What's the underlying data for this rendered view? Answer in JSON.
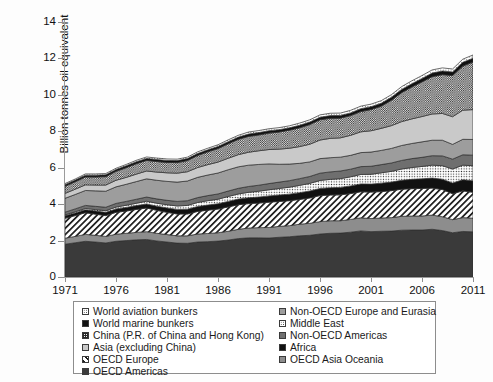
{
  "chart_data": {
    "type": "area",
    "stacked": true,
    "title": "",
    "xlabel": "",
    "ylabel": "Billion tonnes oil equivalent",
    "ylim": [
      0,
      14
    ],
    "yticks": [
      0,
      2,
      4,
      6,
      8,
      10,
      12,
      14
    ],
    "xlim": [
      1971,
      2011
    ],
    "xticks": [
      1971,
      1976,
      1981,
      1986,
      1991,
      1996,
      2001,
      2006,
      2011
    ],
    "grid": false,
    "legend_position": "bottom",
    "x": [
      1971,
      1972,
      1973,
      1974,
      1975,
      1976,
      1977,
      1978,
      1979,
      1980,
      1981,
      1982,
      1983,
      1984,
      1985,
      1986,
      1987,
      1988,
      1989,
      1990,
      1991,
      1992,
      1993,
      1994,
      1995,
      1996,
      1997,
      1998,
      1999,
      2000,
      2001,
      2002,
      2003,
      2004,
      2005,
      2006,
      2007,
      2008,
      2009,
      2010,
      2011
    ],
    "series": [
      {
        "name": "OECD Americas",
        "pattern": "solid-dark",
        "color": "#3a3a3a",
        "values": [
          1.8,
          1.88,
          1.96,
          1.92,
          1.87,
          1.96,
          2.0,
          2.04,
          2.06,
          1.98,
          1.92,
          1.86,
          1.85,
          1.92,
          1.94,
          1.97,
          2.03,
          2.11,
          2.15,
          2.15,
          2.14,
          2.18,
          2.21,
          2.26,
          2.29,
          2.36,
          2.4,
          2.41,
          2.46,
          2.53,
          2.49,
          2.51,
          2.52,
          2.57,
          2.58,
          2.58,
          2.62,
          2.55,
          2.43,
          2.5,
          2.48
        ]
      },
      {
        "name": "OECD Asia Oceania",
        "pattern": "solid-mid",
        "color": "#8d8d8d",
        "values": [
          0.33,
          0.35,
          0.38,
          0.37,
          0.36,
          0.39,
          0.4,
          0.41,
          0.43,
          0.42,
          0.41,
          0.4,
          0.41,
          0.44,
          0.45,
          0.46,
          0.48,
          0.51,
          0.54,
          0.56,
          0.58,
          0.6,
          0.61,
          0.64,
          0.66,
          0.68,
          0.69,
          0.68,
          0.7,
          0.72,
          0.72,
          0.73,
          0.74,
          0.76,
          0.77,
          0.77,
          0.78,
          0.76,
          0.72,
          0.76,
          0.75
        ]
      },
      {
        "name": "OECD Europe",
        "pattern": "diagonal-hatch",
        "color": "#ffffff",
        "values": [
          1.09,
          1.14,
          1.19,
          1.16,
          1.14,
          1.2,
          1.22,
          1.26,
          1.3,
          1.26,
          1.22,
          1.2,
          1.2,
          1.24,
          1.28,
          1.3,
          1.34,
          1.35,
          1.34,
          1.35,
          1.39,
          1.37,
          1.37,
          1.36,
          1.39,
          1.43,
          1.41,
          1.42,
          1.42,
          1.43,
          1.45,
          1.45,
          1.48,
          1.49,
          1.5,
          1.51,
          1.48,
          1.49,
          1.42,
          1.47,
          1.42
        ]
      },
      {
        "name": "Africa",
        "pattern": "black",
        "color": "#111111",
        "values": [
          0.14,
          0.15,
          0.16,
          0.17,
          0.18,
          0.19,
          0.2,
          0.21,
          0.22,
          0.23,
          0.24,
          0.25,
          0.26,
          0.27,
          0.28,
          0.29,
          0.3,
          0.31,
          0.32,
          0.33,
          0.34,
          0.35,
          0.36,
          0.37,
          0.38,
          0.39,
          0.4,
          0.41,
          0.42,
          0.43,
          0.44,
          0.46,
          0.47,
          0.49,
          0.51,
          0.53,
          0.55,
          0.57,
          0.59,
          0.61,
          0.63
        ]
      },
      {
        "name": "Middle East",
        "pattern": "dotted",
        "color": "#ffffff",
        "values": [
          0.05,
          0.06,
          0.07,
          0.08,
          0.09,
          0.1,
          0.12,
          0.13,
          0.15,
          0.16,
          0.18,
          0.19,
          0.21,
          0.22,
          0.24,
          0.25,
          0.27,
          0.28,
          0.3,
          0.32,
          0.34,
          0.36,
          0.38,
          0.4,
          0.42,
          0.44,
          0.46,
          0.48,
          0.5,
          0.52,
          0.54,
          0.57,
          0.59,
          0.62,
          0.65,
          0.68,
          0.71,
          0.74,
          0.77,
          0.8,
          0.83
        ]
      },
      {
        "name": "Non-OECD Americas",
        "pattern": "solid-middark",
        "color": "#6f6f6f",
        "values": [
          0.15,
          0.16,
          0.17,
          0.18,
          0.19,
          0.2,
          0.21,
          0.22,
          0.23,
          0.24,
          0.24,
          0.25,
          0.26,
          0.27,
          0.28,
          0.29,
          0.3,
          0.31,
          0.32,
          0.33,
          0.34,
          0.35,
          0.36,
          0.37,
          0.38,
          0.4,
          0.41,
          0.42,
          0.42,
          0.43,
          0.44,
          0.45,
          0.46,
          0.47,
          0.49,
          0.5,
          0.52,
          0.54,
          0.54,
          0.57,
          0.58
        ]
      },
      {
        "name": "Non-OECD Europe and Eurasia",
        "pattern": "solid-mid2",
        "color": "#9d9d9d",
        "values": [
          0.76,
          0.79,
          0.82,
          0.85,
          0.88,
          0.91,
          0.94,
          0.97,
          1.0,
          1.02,
          1.04,
          1.06,
          1.08,
          1.11,
          1.13,
          1.15,
          1.17,
          1.18,
          1.17,
          1.14,
          1.08,
          0.98,
          0.91,
          0.84,
          0.8,
          0.8,
          0.78,
          0.76,
          0.76,
          0.77,
          0.78,
          0.78,
          0.8,
          0.82,
          0.83,
          0.85,
          0.85,
          0.86,
          0.81,
          0.85,
          0.86
        ]
      },
      {
        "name": "Asia (excluding China)",
        "pattern": "solid-light",
        "color": "#c9c9c9",
        "values": [
          0.27,
          0.29,
          0.31,
          0.32,
          0.34,
          0.36,
          0.38,
          0.41,
          0.43,
          0.45,
          0.47,
          0.49,
          0.51,
          0.54,
          0.57,
          0.6,
          0.63,
          0.67,
          0.71,
          0.75,
          0.79,
          0.83,
          0.87,
          0.92,
          0.97,
          1.02,
          1.06,
          1.06,
          1.1,
          1.14,
          1.17,
          1.21,
          1.25,
          1.31,
          1.35,
          1.39,
          1.44,
          1.47,
          1.52,
          1.6,
          1.64
        ]
      },
      {
        "name": "China (P.R. of China and Hong Kong)",
        "pattern": "checker",
        "color": "#f2f2f2",
        "values": [
          0.39,
          0.41,
          0.43,
          0.44,
          0.46,
          0.49,
          0.53,
          0.57,
          0.58,
          0.58,
          0.57,
          0.58,
          0.61,
          0.66,
          0.7,
          0.74,
          0.79,
          0.84,
          0.87,
          0.87,
          0.9,
          0.94,
          0.99,
          1.03,
          1.08,
          1.11,
          1.1,
          1.08,
          1.08,
          1.11,
          1.16,
          1.22,
          1.39,
          1.59,
          1.75,
          1.9,
          2.05,
          2.13,
          2.26,
          2.42,
          2.61
        ]
      },
      {
        "name": "World marine bunkers",
        "pattern": "black",
        "color": "#111111",
        "values": [
          0.09,
          0.09,
          0.1,
          0.1,
          0.1,
          0.1,
          0.11,
          0.11,
          0.11,
          0.11,
          0.11,
          0.11,
          0.11,
          0.11,
          0.11,
          0.12,
          0.12,
          0.12,
          0.13,
          0.13,
          0.13,
          0.13,
          0.13,
          0.14,
          0.14,
          0.14,
          0.15,
          0.15,
          0.15,
          0.16,
          0.16,
          0.16,
          0.17,
          0.18,
          0.18,
          0.19,
          0.2,
          0.2,
          0.2,
          0.21,
          0.21
        ]
      },
      {
        "name": "World aviation bunkers",
        "pattern": "dotted-white",
        "color": "#ffffff",
        "values": [
          0.06,
          0.06,
          0.07,
          0.07,
          0.07,
          0.07,
          0.07,
          0.08,
          0.08,
          0.08,
          0.08,
          0.08,
          0.08,
          0.09,
          0.09,
          0.09,
          0.1,
          0.1,
          0.11,
          0.11,
          0.11,
          0.11,
          0.11,
          0.12,
          0.12,
          0.13,
          0.13,
          0.13,
          0.14,
          0.14,
          0.14,
          0.14,
          0.14,
          0.15,
          0.16,
          0.16,
          0.17,
          0.17,
          0.16,
          0.17,
          0.18
        ]
      }
    ]
  },
  "axes": {
    "ylabel": "Billion tonnes oil equivalent",
    "ytick_labels": [
      "0",
      "2",
      "4",
      "6",
      "8",
      "10",
      "12",
      "14"
    ],
    "xtick_labels": [
      "1971",
      "1976",
      "1981",
      "1986",
      "1991",
      "1996",
      "2001",
      "2006",
      "2011"
    ]
  },
  "legend": {
    "left_column": [
      {
        "label": "World aviation bunkers",
        "pattern": "dotted-white"
      },
      {
        "label": "World marine bunkers",
        "pattern": "black"
      },
      {
        "label": "China (P.R. of China and Hong Kong)",
        "pattern": "checker"
      },
      {
        "label": "Asia (excluding China)",
        "pattern": "solid-light"
      },
      {
        "label": "OECD Europe",
        "pattern": "diagonal-hatch"
      },
      {
        "label": "OECD Americas",
        "pattern": "solid-dark"
      }
    ],
    "right_column": [
      {
        "label": "Non-OECD Europe and Eurasia",
        "pattern": "solid-mid2"
      },
      {
        "label": "Middle East",
        "pattern": "dotted"
      },
      {
        "label": "Non-OECD Americas",
        "pattern": "solid-middark"
      },
      {
        "label": "Africa",
        "pattern": "black"
      },
      {
        "label": "OECD Asia Oceania",
        "pattern": "solid-mid"
      }
    ]
  }
}
